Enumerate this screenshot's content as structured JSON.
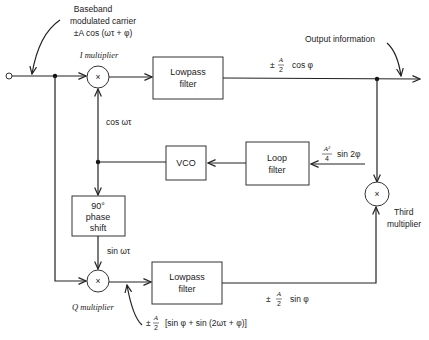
{
  "diagram": {
    "type": "block-diagram",
    "input": {
      "label_line1": "Baseband",
      "label_line2": "modulated carrier",
      "label_line3": "±A cos (ωτ + φ)"
    },
    "output": {
      "label": "Output information"
    },
    "blocks": {
      "i_multiplier": {
        "symbol": "×",
        "label": "I multiplier"
      },
      "q_multiplier": {
        "symbol": "×",
        "label": "Q multiplier"
      },
      "third_multiplier": {
        "symbol": "×",
        "label_line1": "Third",
        "label_line2": "multiplier"
      },
      "lpf_top": {
        "line1": "Lowpass",
        "line2": "filter"
      },
      "lpf_bottom": {
        "line1": "Lowpass",
        "line2": "filter"
      },
      "vco": {
        "label": "VCO"
      },
      "loop_filter": {
        "line1": "Loop",
        "line2": "filter"
      },
      "phase_shift": {
        "line1": "90°",
        "line2": "phase",
        "line3": "shift"
      }
    },
    "signals": {
      "cos_ref": "cos ωτ",
      "sin_ref": "sin ωτ",
      "i_out_prefix": "±",
      "i_out_num": "A",
      "i_out_den": "2",
      "i_out_func": "cos φ",
      "q_out_prefix": "±",
      "q_out_num": "A",
      "q_out_den": "2",
      "q_out_func": "sin φ",
      "error_num": "A²",
      "error_den": "4",
      "error_func": "sin 2φ",
      "q_mixer_prefix": "±",
      "q_mixer_num": "A",
      "q_mixer_den": "2",
      "q_mixer_func": "[sin φ + sin (2ωτ + φ)]"
    }
  }
}
